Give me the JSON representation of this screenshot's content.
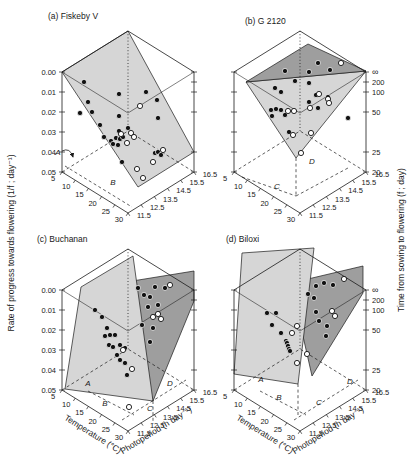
{
  "figure": {
    "width": 419,
    "height": 473,
    "background": "#ffffff"
  },
  "chart_data": {
    "type": "scatter",
    "note_units": "panel-local pixel coordinates of 3D-projected points",
    "colors": {
      "light_plane": "#d6d6d6",
      "dark_plane": "#9e9e9e",
      "line": "#1a1a1a",
      "point_fill": "#111111",
      "point_open": "#ffffff"
    },
    "box": {
      "L": [
        34,
        157
      ],
      "F": [
        100,
        198
      ],
      "R": [
        166,
        157
      ],
      "B": [
        100,
        116
      ],
      "Lt": [
        34,
        57
      ],
      "Ft": [
        100,
        98
      ],
      "Rt": [
        166,
        57
      ],
      "Bt": [
        100,
        16
      ]
    },
    "axes": {
      "left_label": "Rate of progress towards flowering (1/f ; day⁻¹)",
      "right_label": "Time from sowing to flowering (f ; day)",
      "temp_label": "Temperature (°C)",
      "photo_label": "Photoperiod (h day⁻¹)",
      "rate_ticks": [
        [
          "0.00",
          57
        ],
        [
          "0.01",
          77
        ],
        [
          "0.02",
          97
        ],
        [
          "0.03",
          117
        ],
        [
          "0.04",
          137
        ],
        [
          "0.05",
          157
        ]
      ],
      "time_ticks": [
        [
          "∞",
          57
        ],
        [
          "200",
          67
        ],
        [
          "100",
          77
        ],
        [
          "50",
          97
        ],
        [
          "25",
          137
        ],
        [
          "20",
          157
        ]
      ],
      "temp_ticks": [
        [
          "5",
          0
        ],
        [
          "10",
          0.2
        ],
        [
          "15",
          0.4
        ],
        [
          "20",
          0.6
        ],
        [
          "25",
          0.8
        ],
        [
          "30",
          1
        ]
      ],
      "photo_ticks": [
        [
          "11.5",
          0
        ],
        [
          "12.5",
          0.2
        ],
        [
          "13.5",
          0.4
        ],
        [
          "14.5",
          0.6
        ],
        [
          "15.5",
          0.8
        ],
        [
          "16.5",
          1
        ]
      ],
      "temp_range": [
        5,
        30
      ],
      "photo_range": [
        11.5,
        16.5
      ],
      "rate_range": [
        0.0,
        0.05
      ]
    },
    "panels": [
      {
        "id": "a",
        "title": "(a) Fiskeby V",
        "origin": [
          28,
          15
        ],
        "show_rate_labels": true,
        "show_time_labels": false,
        "planes": [
          {
            "shade": "light",
            "pts": [
              [
                34,
                57
              ],
              [
                100,
                16
              ],
              [
                166,
                137
              ],
              [
                110,
                172
              ]
            ]
          }
        ],
        "dashes": [
          [
            [
              37,
              151
            ],
            [
              104,
              192
            ]
          ]
        ],
        "labels": [
          {
            "t": "A",
            "x": 30,
            "y": 140,
            "arrow": true
          },
          {
            "t": "B",
            "x": 85,
            "y": 170
          }
        ],
        "filled": [
          [
            56,
            67
          ],
          [
            91,
            79
          ],
          [
            118,
            77
          ],
          [
            129,
            85
          ],
          [
            60,
            87
          ],
          [
            52,
            98
          ],
          [
            64,
            97
          ],
          [
            91,
            101
          ],
          [
            130,
            103
          ],
          [
            72,
            110
          ],
          [
            91,
            116
          ],
          [
            100,
            113
          ],
          [
            76,
            122
          ],
          [
            83,
            126
          ],
          [
            88,
            123
          ],
          [
            92,
            124
          ],
          [
            95,
            122
          ],
          [
            85,
            129
          ],
          [
            90,
            130
          ],
          [
            127,
            138
          ],
          [
            130,
            137
          ],
          [
            133,
            140
          ],
          [
            94,
            147
          ]
        ],
        "open": [
          [
            112,
            91
          ],
          [
            93,
            119
          ],
          [
            103,
            118
          ],
          [
            106,
            122
          ],
          [
            99,
            128
          ],
          [
            135,
            135
          ],
          [
            125,
            147
          ],
          [
            109,
            154
          ],
          [
            115,
            163
          ]
        ]
      },
      {
        "id": "b",
        "title": "(b) G 2120",
        "origin": [
          200,
          15
        ],
        "show_rate_labels": false,
        "show_time_labels": true,
        "planes": [
          {
            "shade": "light",
            "pts": [
              [
                46,
                67
              ],
              [
                166,
                56
              ],
              [
                96,
                143
              ]
            ]
          },
          {
            "shade": "dark",
            "pts": [
              [
                46,
                67
              ],
              [
                108,
                29
              ],
              [
                166,
                56
              ]
            ]
          }
        ],
        "dashes": [
          [
            [
              42,
              162
            ],
            [
              96,
              181
            ]
          ],
          [
            [
              96,
              181
            ],
            [
              148,
              153
            ]
          ],
          [
            [
              96,
              143
            ],
            [
              96,
              181
            ]
          ]
        ],
        "labels": [
          {
            "t": "C",
            "x": 77,
            "y": 174
          },
          {
            "t": "D",
            "x": 112,
            "y": 149
          }
        ],
        "filled": [
          [
            85,
            56
          ],
          [
            95,
            66
          ],
          [
            118,
            48
          ],
          [
            130,
            55
          ],
          [
            109,
            57
          ],
          [
            75,
            73
          ],
          [
            81,
            77
          ],
          [
            109,
            68
          ],
          [
            116,
            80
          ],
          [
            128,
            82
          ],
          [
            109,
            87
          ],
          [
            118,
            93
          ],
          [
            71,
            95
          ],
          [
            76,
            94
          ],
          [
            81,
            95
          ],
          [
            85,
            100
          ],
          [
            72,
            101
          ],
          [
            148,
            103
          ],
          [
            89,
            117
          ]
        ],
        "open": [
          [
            141,
            48
          ],
          [
            119,
            79
          ],
          [
            128,
            84
          ],
          [
            129,
            88
          ],
          [
            110,
            93
          ],
          [
            88,
            96
          ],
          [
            94,
            96
          ],
          [
            111,
            118
          ],
          [
            93,
            120
          ],
          [
            101,
            138
          ]
        ]
      },
      {
        "id": "c",
        "title": "(c) Buchanan",
        "origin": [
          28,
          233
        ],
        "show_rate_labels": true,
        "show_time_labels": false,
        "planes": [
          {
            "shade": "dark",
            "pts": [
              [
                92,
                50
              ],
              [
                166,
                38
              ],
              [
                166,
                68
              ],
              [
                125,
                168
              ]
            ]
          },
          {
            "shade": "light",
            "pts": [
              [
                53,
                54
              ],
              [
                105,
                23
              ],
              [
                125,
                168
              ],
              [
                37,
                156
              ]
            ]
          }
        ],
        "dashes": [
          [
            [
              60,
              158
            ],
            [
              106,
              182
            ]
          ],
          [
            [
              94,
              187
            ],
            [
              158,
              147
            ]
          ],
          [
            [
              125,
              168
            ],
            [
              125,
              191
            ]
          ]
        ],
        "labels": [
          {
            "t": "A",
            "x": 60,
            "y": 153
          },
          {
            "t": "B",
            "x": 77,
            "y": 173
          },
          {
            "t": "C",
            "x": 122,
            "y": 178
          },
          {
            "t": "D",
            "x": 142,
            "y": 153
          }
        ],
        "filled": [
          [
            67,
            77
          ],
          [
            74,
            84
          ],
          [
            79,
            95
          ],
          [
            82,
            102
          ],
          [
            77,
            103
          ],
          [
            87,
            102
          ],
          [
            81,
            112
          ],
          [
            85,
            114
          ],
          [
            92,
            112
          ],
          [
            97,
            115
          ],
          [
            89,
            122
          ],
          [
            92,
            127
          ],
          [
            97,
            130
          ],
          [
            110,
            55
          ],
          [
            116,
            62
          ],
          [
            122,
            64
          ],
          [
            127,
            54
          ],
          [
            137,
            55
          ],
          [
            130,
            72
          ],
          [
            120,
            74
          ],
          [
            114,
            92
          ],
          [
            125,
            95
          ],
          [
            122,
            109
          ],
          [
            99,
            142
          ]
        ],
        "open": [
          [
            104,
            136
          ],
          [
            125,
            84
          ],
          [
            130,
            81
          ],
          [
            133,
            86
          ],
          [
            95,
            117
          ],
          [
            142,
            52
          ],
          [
            101,
            174
          ]
        ]
      },
      {
        "id": "d",
        "title": "(d) Biloxi",
        "origin": [
          200,
          233
        ],
        "show_rate_labels": false,
        "show_time_labels": true,
        "planes": [
          {
            "shade": "dark",
            "pts": [
              [
                91,
                50
              ],
              [
                163,
                33
              ],
              [
                163,
                60
              ],
              [
                112,
                143
              ]
            ]
          },
          {
            "shade": "light",
            "pts": [
              [
                42,
                20
              ],
              [
                114,
                15
              ],
              [
                98,
                151
              ],
              [
                34,
                141
              ]
            ]
          }
        ],
        "dashes": [
          [
            [
              60,
              158
            ],
            [
              106,
              182
            ]
          ],
          [
            [
              94,
              187
            ],
            [
              158,
              147
            ]
          ],
          [
            [
              98,
              151
            ],
            [
              98,
              184
            ]
          ]
        ],
        "labels": [
          {
            "t": "A",
            "x": 61,
            "y": 149
          },
          {
            "t": "B",
            "x": 79,
            "y": 167
          },
          {
            "t": "C",
            "x": 119,
            "y": 172
          },
          {
            "t": "D",
            "x": 150,
            "y": 151
          }
        ],
        "filled": [
          [
            67,
            80
          ],
          [
            76,
            80
          ],
          [
            72,
            92
          ],
          [
            81,
            100
          ],
          [
            86,
            108
          ],
          [
            87,
            110
          ],
          [
            88,
            113
          ],
          [
            89,
            116
          ],
          [
            90,
            118
          ],
          [
            116,
            53
          ],
          [
            124,
            50
          ],
          [
            133,
            52
          ],
          [
            108,
            61
          ],
          [
            114,
            65
          ],
          [
            116,
            79
          ],
          [
            127,
            93
          ],
          [
            126,
            103
          ],
          [
            119,
            88
          ]
        ],
        "open": [
          [
            144,
            46
          ],
          [
            132,
            78
          ],
          [
            135,
            83
          ],
          [
            97,
            93
          ],
          [
            92,
            100
          ],
          [
            107,
            121
          ],
          [
            97,
            130
          ]
        ]
      }
    ]
  }
}
